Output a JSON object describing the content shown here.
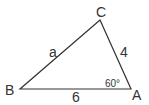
{
  "diagram": {
    "type": "triangle",
    "vertices": [
      {
        "name": "B",
        "x": 20,
        "y": 89
      },
      {
        "name": "A",
        "x": 131,
        "y": 89
      },
      {
        "name": "C",
        "x": 100,
        "y": 20
      }
    ],
    "labels": {
      "vertex_b": "B",
      "vertex_a": "A",
      "vertex_c": "C",
      "side_bc": "a",
      "side_ca": "4",
      "side_ab": "6",
      "angle_a": "60°"
    },
    "stroke_color": "#333333"
  }
}
